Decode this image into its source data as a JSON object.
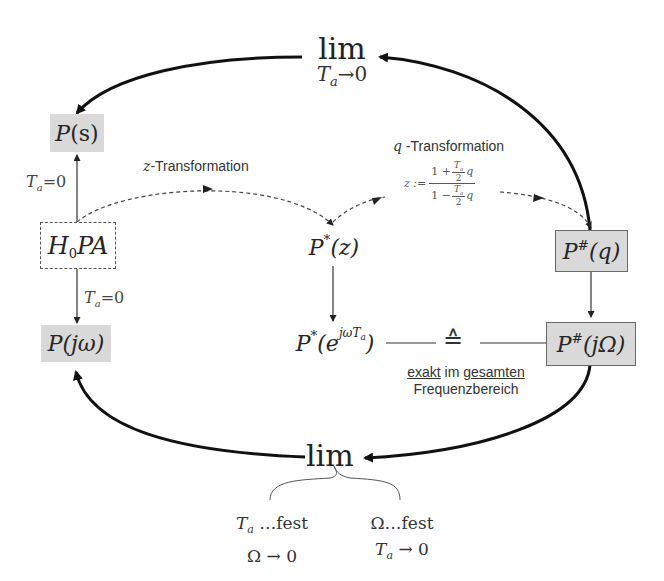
{
  "diagram": {
    "nodes": {
      "p_s": {
        "base": "P",
        "arg": "(s)"
      },
      "h0pa": {
        "main_a": "H",
        "sub": "0",
        "main_b": "PA"
      },
      "p_jw": {
        "base": "P",
        "arg": "(jω)"
      },
      "p_star_z": {
        "base": "P",
        "sup": "*",
        "arg": "(z)"
      },
      "p_star_e": {
        "base": "P",
        "sup": "*",
        "open": "(e",
        "exp": "jωT",
        "exp_sub": "a",
        "close": ")"
      },
      "p_hash_q": {
        "base": "P",
        "sup": "#",
        "arg": "(q)"
      },
      "p_hash_jOmega": {
        "base": "P",
        "sup": "#",
        "arg": "(jΩ)"
      }
    },
    "labels": {
      "lim_top": {
        "lim": "lim",
        "var": "T",
        "var_sub": "a",
        "cond": "→0"
      },
      "lim_bottom": {
        "lim": "lim"
      },
      "ta0_up": {
        "var": "T",
        "sub": "a",
        "eq": "=0"
      },
      "ta0_down": {
        "var": "T",
        "sub": "a",
        "eq": "=0"
      },
      "z_transform": {
        "var": "z",
        "text": "-Transformation"
      },
      "q_transform": {
        "var": "q",
        "text": " -Transformation"
      },
      "q_formula": {
        "lhs": "z :=",
        "num_a": "1 +",
        "num_frac_num": "T",
        "num_frac_sub": "a",
        "num_frac_den": "2",
        "num_q": "q",
        "den_a": "1 −",
        "den_frac_num": "T",
        "den_frac_sub": "a",
        "den_frac_den": "2",
        "den_q": "q"
      },
      "corresponds": "≙",
      "exact_line1_a": "exakt",
      "exact_line1_b": " im ",
      "exact_line1_c": "gesamten",
      "exact_line2": "Frequenzbereich",
      "case_left": {
        "var": "T",
        "sub": "a",
        "fixed": " …fest",
        "limit": "Ω → 0"
      },
      "case_right": {
        "fixed": "Ω…fest",
        "var": "T",
        "sub": "a",
        "limit": " → 0"
      }
    },
    "colors": {
      "shaded_box": "#d9d9d9",
      "thick_arrow": "#111111",
      "thin_line": "#333333",
      "dashed_line": "#444444"
    }
  }
}
